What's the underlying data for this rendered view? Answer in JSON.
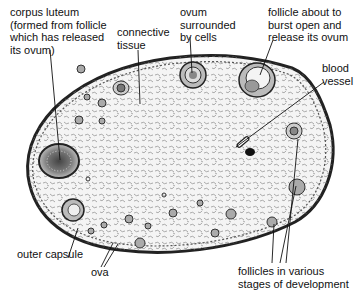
{
  "diagram": {
    "colors": {
      "ink": "#111111",
      "background": "#ffffff",
      "stroma": "#f2f2f2"
    },
    "labels": {
      "corpus_luteum": "corpus luteum\n(formed from follicle\nwhich has released\nits ovum)",
      "connective_tissue": "connective\ntissue",
      "ovum_surrounded": "ovum\nsurrounded\nby cells",
      "follicle_burst": "follicle about to\nburst open and\nrelease its ovum",
      "blood_vessel": "blood\nvessel",
      "outer_capsule": "outer capsule",
      "ova": "ova",
      "follicles_stages": "follicles in various\nstages of development"
    }
  }
}
